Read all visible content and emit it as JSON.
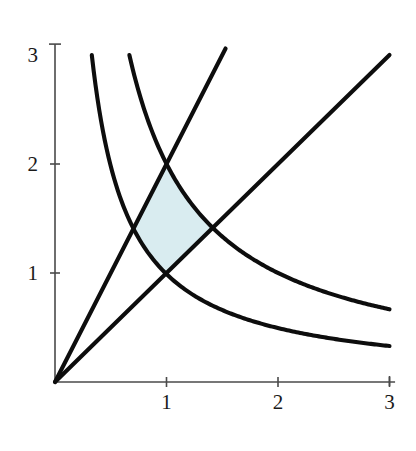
{
  "figure": {
    "title": "",
    "background_color": "#ffffff",
    "width": 416,
    "height": 451
  },
  "axes": {
    "x_label": "",
    "y_label": "",
    "x_ticks": [
      "1",
      "2",
      "3"
    ],
    "y_ticks": [
      "1",
      "2",
      "3"
    ],
    "x_tick_values": [
      1,
      2,
      3
    ],
    "y_tick_values": [
      1,
      2,
      3
    ],
    "xlim": [
      0,
      3.05
    ],
    "ylim": [
      0,
      3.1
    ],
    "axis_color": "#4a4a4a",
    "origin_label": ""
  },
  "chart_data": {
    "type": "line",
    "title": "",
    "subtitle": "",
    "xlabel": "",
    "ylabel": "",
    "xlim": [
      0,
      3.05
    ],
    "ylim": [
      0,
      3.1
    ],
    "grid": false,
    "legend_position": "none",
    "x_ticks": [
      1,
      2,
      3
    ],
    "y_ticks": [
      1,
      2,
      3
    ],
    "curve_color": "#0d0d0d",
    "shaded_region_color": "#d9ecf0",
    "series": [
      {
        "name": "xy = 1",
        "equation": "y = 1/x",
        "kind": "hyperbola",
        "x": [
          0.33,
          0.4,
          0.5,
          0.6,
          0.71,
          0.85,
          1.0,
          1.2,
          1.41,
          1.7,
          2.0,
          2.4,
          3.0
        ],
        "values": [
          3.0,
          2.5,
          2.0,
          1.667,
          1.41,
          1.176,
          1.0,
          0.833,
          0.709,
          0.588,
          0.5,
          0.417,
          0.333
        ]
      },
      {
        "name": "xy = 2",
        "equation": "y = 2/x",
        "kind": "hyperbola",
        "x": [
          0.667,
          0.8,
          1.0,
          1.2,
          1.41,
          1.7,
          2.0,
          2.4,
          2.7,
          3.0
        ],
        "values": [
          3.0,
          2.5,
          2.0,
          1.667,
          1.41,
          1.176,
          1.0,
          0.833,
          0.741,
          0.667
        ]
      },
      {
        "name": "y = x",
        "equation": "y = x",
        "kind": "line",
        "x": [
          0,
          3.0
        ],
        "values": [
          0,
          3.0
        ]
      },
      {
        "name": "y = 2x",
        "equation": "y = 2x",
        "kind": "line",
        "x": [
          0,
          1.53
        ],
        "values": [
          0,
          3.06
        ]
      }
    ],
    "shaded_region": {
      "name": "bounded region",
      "description": "Region bounded by xy=1, xy=2, y=x, y=2x in the first quadrant",
      "vertices": [
        {
          "x": 1.0,
          "y": 1.0,
          "label": "xy=1 ∩ y=x"
        },
        {
          "x": 0.707,
          "y": 1.414,
          "label": "xy=1 ∩ y=2x"
        },
        {
          "x": 1.0,
          "y": 2.0,
          "label": "xy=2 ∩ y=2x"
        },
        {
          "x": 1.414,
          "y": 1.414,
          "label": "xy=2 ∩ y=x"
        }
      ],
      "fill_color": "#d9ecf0"
    }
  }
}
